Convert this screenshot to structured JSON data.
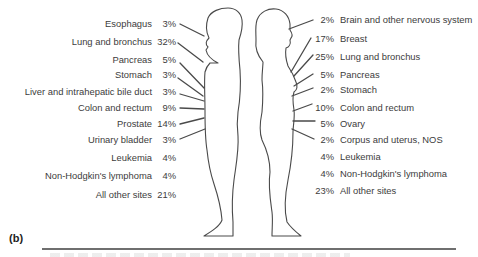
{
  "panel_label": "(b)",
  "male": {
    "sex": "male",
    "items": [
      {
        "site": "Esophagus",
        "percent": "3%"
      },
      {
        "site": "Lung and bronchus",
        "percent": "32%"
      },
      {
        "site": "Pancreas",
        "percent": "5%"
      },
      {
        "site": "Stomach",
        "percent": "3%"
      },
      {
        "site": "Liver and intrahepatic bile duct",
        "percent": "3%"
      },
      {
        "site": "Colon and rectum",
        "percent": "9%"
      },
      {
        "site": "Prostate",
        "percent": "14%"
      },
      {
        "site": "Urinary bladder",
        "percent": "3%"
      },
      {
        "site": "Leukemia",
        "percent": "4%"
      },
      {
        "site": "Non-Hodgkin's lymphoma",
        "percent": "4%"
      },
      {
        "site": "All other sites",
        "percent": "21%"
      }
    ]
  },
  "female": {
    "sex": "female",
    "items": [
      {
        "site": "Brain and other nervous system",
        "percent": "2%"
      },
      {
        "site": "Breast",
        "percent": "17%"
      },
      {
        "site": "Lung and bronchus",
        "percent": "25%"
      },
      {
        "site": "Pancreas",
        "percent": "5%"
      },
      {
        "site": "Stomach",
        "percent": "2%"
      },
      {
        "site": "Colon and rectum",
        "percent": "10%"
      },
      {
        "site": "Ovary",
        "percent": "5%"
      },
      {
        "site": "Corpus and uterus, NOS",
        "percent": "2%"
      },
      {
        "site": "Leukemia",
        "percent": "4%"
      },
      {
        "site": "Non-Hodgkin's lymphoma",
        "percent": "4%"
      },
      {
        "site": "All other sites",
        "percent": "23%"
      }
    ]
  },
  "colors": {
    "text": "#3c3c3c",
    "outline": "#4a4a4a",
    "rule": "#6f6f6f",
    "background": "#ffffff"
  }
}
